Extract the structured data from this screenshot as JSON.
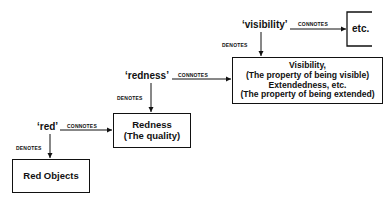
{
  "diagram": {
    "type": "semantic-ladder",
    "relations": {
      "connotes": "CONNOTES",
      "denotes": "DENOTES"
    },
    "levels": [
      {
        "term": "'red'",
        "denotes": "Red Objects",
        "connotes": [
          "Redness",
          "(The quality)"
        ]
      },
      {
        "term": "'redness'",
        "denotes": [
          "Redness",
          "(The quality)"
        ],
        "connotes": [
          "Visibility,",
          "(The property of being visible)",
          "Extendedness, etc.",
          "(The property of being extended)"
        ]
      },
      {
        "term": "'visibility'",
        "denotes": [
          "Visibility,",
          "(The property of being visible)",
          "Extendedness, etc.",
          "(The property of being extended)"
        ],
        "connotes": "etc."
      }
    ]
  },
  "labels": {
    "red_term": "‘red’",
    "redness_term": "‘redness’",
    "visibility_term": "‘visibility’",
    "connotes": "CONNOTES",
    "denotes": "DENOTES",
    "red_objects": "Red Objects",
    "redness_box": {
      "line1": "Redness",
      "line2": "(The quality)"
    },
    "visibility_box": {
      "line1": "Visibility,",
      "line2": "(The property of being visible)",
      "line3": "Extendedness, etc.",
      "line4": "(The property of being extended)"
    },
    "etc_box": "etc."
  },
  "colors": {
    "ink": "#111111",
    "background": "#ffffff"
  }
}
